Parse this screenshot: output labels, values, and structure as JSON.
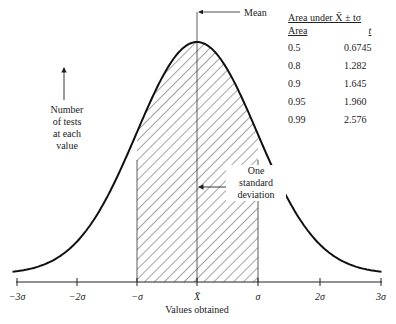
{
  "chart_data": {
    "type": "area",
    "xlabel": "Values obtained",
    "ylabel": "Number of tests at each value",
    "x_ticks": [
      "-3σ",
      "-2σ",
      "-σ",
      "X̄",
      "σ",
      "2σ",
      "3σ"
    ],
    "x_tick_values": [
      -3,
      -2,
      -1,
      0,
      1,
      2,
      3
    ],
    "curve": "normal (Gaussian) bell curve centered at mean X̄",
    "shaded_region": {
      "from": -1,
      "to": 1,
      "pattern": "diagonal hatching"
    },
    "annotations": [
      {
        "text": "Mean",
        "points_to": "peak / X̄ line"
      },
      {
        "text": "One standard deviation",
        "span": [
          0,
          1
        ]
      }
    ],
    "table": {
      "title": "Area under X̄ ± tσ",
      "columns": [
        "Area",
        "t"
      ],
      "rows": [
        [
          "0.5",
          "0.6745"
        ],
        [
          "0.8",
          "1.282"
        ],
        [
          "0.9",
          "1.645"
        ],
        [
          "0.95",
          "1.960"
        ],
        [
          "0.99",
          "2.576"
        ]
      ]
    },
    "grid": false,
    "xlim": [
      -3,
      3
    ]
  },
  "labels": {
    "ylabel_lines": [
      "Number",
      "of tests",
      "at each",
      "value"
    ],
    "mean": "Mean",
    "sd_lines": [
      "One",
      "standard",
      "deviation"
    ],
    "xlabel": "Values obtained",
    "ticks": [
      "−3σ",
      "−2σ",
      "−σ",
      "X̄",
      "σ",
      "2σ",
      "3σ"
    ]
  },
  "table": {
    "title": "Area under X̄ ± tσ",
    "col_area": "Area",
    "col_t": "t",
    "rows": [
      {
        "area": "0.5",
        "t": "0.6745"
      },
      {
        "area": "0.8",
        "t": "1.282"
      },
      {
        "area": "0.9",
        "t": "1.645"
      },
      {
        "area": "0.95",
        "t": "1.960"
      },
      {
        "area": "0.99",
        "t": "2.576"
      }
    ]
  }
}
